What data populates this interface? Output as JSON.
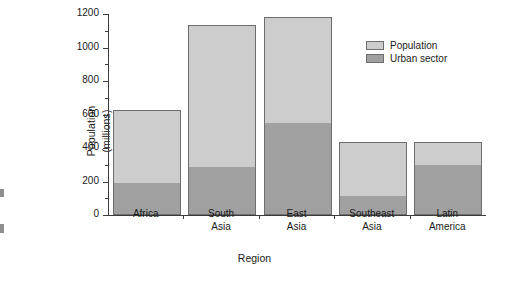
{
  "chart_data": {
    "type": "bar",
    "subtype": "stacked",
    "title": "",
    "xlabel": "Region",
    "ylabel": "Population\n(millions)",
    "ylabel_lines": [
      "Population",
      "(millions)"
    ],
    "categories": [
      "Africa",
      "South Asia",
      "East Asia",
      "Southeast Asia",
      "Latin America"
    ],
    "category_label_lines": [
      [
        "Africa"
      ],
      [
        "South",
        "Asia"
      ],
      [
        "East",
        "Asia"
      ],
      [
        "Southeast",
        "Asia"
      ],
      [
        "Latin",
        "America"
      ]
    ],
    "series": [
      {
        "name": "Urban sector",
        "color": "#a0a0a0",
        "values": [
          191,
          287,
          549,
          113,
          300
        ]
      },
      {
        "name": "Population",
        "color": "#cdcdcd",
        "values": [
          624,
          1134,
          1182,
          436,
          436
        ]
      }
    ],
    "stack_note": "Population is the full bar total; Urban sector is the lower shaded portion of the same bar.",
    "ylim": [
      0,
      1200
    ],
    "ytick_values": [
      0,
      200,
      400,
      600,
      800,
      1000,
      1200
    ],
    "ytick_labels": [
      "0",
      "200",
      "400",
      "600",
      "800",
      "1000",
      "1200"
    ],
    "yminor_interval": 100,
    "grid": false,
    "legend": {
      "position": "top-right-inside",
      "entries": [
        {
          "label": "Population",
          "color": "#cdcdcd"
        },
        {
          "label": "Urban sector",
          "color": "#a0a0a0"
        }
      ]
    },
    "axis_color": "#3b3b3b",
    "background": "#ffffff"
  }
}
